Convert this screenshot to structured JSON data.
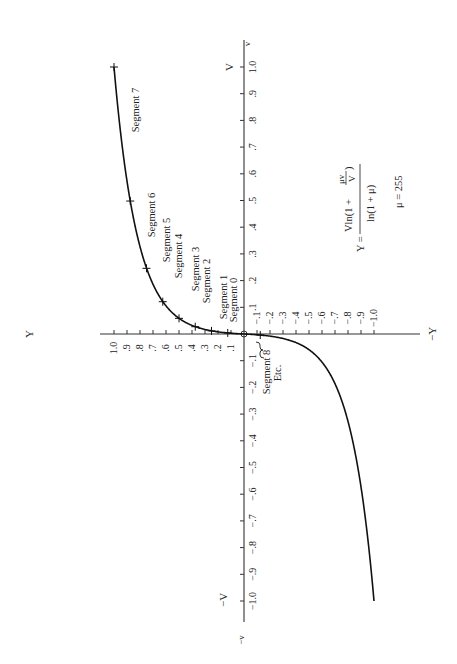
{
  "chart_data": {
    "type": "line",
    "title": "",
    "orientation": "rotated 90° counter-clockwise (V axis vertical, Y axis horizontal)",
    "xlabel": "V",
    "ylabel": "Y",
    "axis_end_labels": {
      "v_pos": "V",
      "v_pos_end": "v",
      "v_neg": "−V",
      "v_neg_end": "−v",
      "y_pos": "Y",
      "y_neg": "−Y"
    },
    "xlim": [
      -1.0,
      1.0
    ],
    "ylim": [
      -1.0,
      1.0
    ],
    "grid": false,
    "legend": null,
    "v_ticks_pos": [
      ".1",
      ".2",
      ".3",
      ".4",
      ".5",
      ".6",
      ".7",
      ".8",
      ".9",
      "1.0"
    ],
    "v_ticks_neg": [
      "−.1",
      "−.2",
      "−.3",
      "−.4",
      "−.5",
      "−.6",
      "−.7",
      "−.8",
      "−.9",
      "−1.0"
    ],
    "y_ticks_pos": [
      ".1",
      ".2",
      ".3",
      ".4",
      ".5",
      ".6",
      ".7",
      ".8",
      ".9",
      "1.0"
    ],
    "y_ticks_neg": [
      "−.1",
      "−.2",
      "−.3",
      "−.4",
      "−.5",
      "−.6",
      "−.7",
      "−.8",
      "−.9",
      "−1.0"
    ],
    "formula": {
      "lhs": "Y =",
      "numerator": "Vln(1 + μv/V)",
      "numerator_main": "Vln(1 +",
      "numerator_frac_top": "μv",
      "numerator_frac_bottom": "V",
      "numerator_close": ")",
      "denominator": "ln(1 + μ)",
      "mu": "μ = 255"
    },
    "series": [
      {
        "name": "μ-law companding curve (μ = 255)",
        "x": [
          -1.0,
          -0.8,
          -0.6,
          -0.5,
          -0.4,
          -0.3,
          -0.2,
          -0.1,
          -0.05,
          -0.02,
          -0.01,
          0.0,
          0.01,
          0.02,
          0.05,
          0.1,
          0.2,
          0.3,
          0.4,
          0.5,
          0.6,
          0.8,
          1.0
        ],
        "values": [
          -1.0,
          -0.96,
          -0.907,
          -0.876,
          -0.836,
          -0.785,
          -0.714,
          -0.591,
          -0.471,
          -0.322,
          -0.228,
          0.0,
          0.228,
          0.322,
          0.471,
          0.591,
          0.714,
          0.785,
          0.836,
          0.876,
          0.907,
          0.96,
          1.0
        ]
      }
    ],
    "segment_breakpoints": [
      {
        "v": 0.0039,
        "y": 0.125
      },
      {
        "v": 0.0117,
        "y": 0.25
      },
      {
        "v": 0.0273,
        "y": 0.375
      },
      {
        "v": 0.0586,
        "y": 0.5
      },
      {
        "v": 0.121,
        "y": 0.625
      },
      {
        "v": 0.246,
        "y": 0.75
      },
      {
        "v": 0.498,
        "y": 0.875
      },
      {
        "v": 1.0,
        "y": 1.0
      },
      {
        "v": -0.0039,
        "y": -0.125
      }
    ],
    "annotations": [
      "Segment 0",
      "Segment 1",
      "Segment 2",
      "Segment 3",
      "Segment 4",
      "Segment 5",
      "Segment 6",
      "Segment 7",
      "Segment 8",
      "Etc."
    ]
  },
  "segments": {
    "s0": "Segment 0",
    "s1": "Segment 1",
    "s2": "Segment 2",
    "s3": "Segment 3",
    "s4": "Segment 4",
    "s5": "Segment 5",
    "s6": "Segment 6",
    "s7": "Segment 7",
    "s8": "Segment 8",
    "etc": "Etc."
  }
}
